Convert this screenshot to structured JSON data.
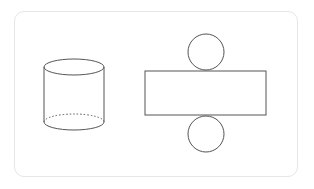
{
  "diagram": {
    "stroke_color": "#555555",
    "card_border_color": "#e6e6e6",
    "shapes": {
      "cylinder": {
        "left": 44,
        "right": 104,
        "top_cy": 67,
        "bottom_cy": 122,
        "ry": 8
      },
      "net_rectangle": {
        "x": 145,
        "y": 71,
        "width": 121,
        "height": 44
      },
      "net_top_circle": {
        "cx": 206,
        "cy": 51,
        "r": 18
      },
      "net_bottom_circle": {
        "cx": 206,
        "cy": 134,
        "r": 18
      }
    }
  }
}
